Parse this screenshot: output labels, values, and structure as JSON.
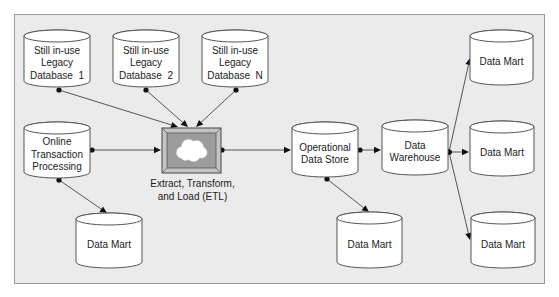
{
  "diagram": {
    "nodes": [
      {
        "id": "legacy1",
        "type": "database",
        "lines": [
          "Still in-use",
          "Legacy",
          "Database  1"
        ]
      },
      {
        "id": "legacy2",
        "type": "database",
        "lines": [
          "Still in-use",
          "Legacy",
          "Database  2"
        ]
      },
      {
        "id": "legacyN",
        "type": "database",
        "lines": [
          "Still in-use",
          "Legacy",
          "Database  N"
        ]
      },
      {
        "id": "oltp",
        "type": "database",
        "lines": [
          "Online",
          "Transaction",
          "Processing"
        ]
      },
      {
        "id": "etl",
        "type": "process",
        "icon": "cloud-icon",
        "lines": [
          "Extract, Transform,",
          "and Load (ETL)"
        ]
      },
      {
        "id": "ods",
        "type": "database",
        "lines": [
          "Operational",
          "Data Store"
        ]
      },
      {
        "id": "dw",
        "type": "database",
        "lines": [
          "Data",
          "Warehouse"
        ]
      },
      {
        "id": "mart_oltp",
        "type": "database",
        "lines": [
          "Data Mart"
        ]
      },
      {
        "id": "mart_ods",
        "type": "database",
        "lines": [
          "Data Mart"
        ]
      },
      {
        "id": "mart_dw1",
        "type": "database",
        "lines": [
          "Data Mart"
        ]
      },
      {
        "id": "mart_dw2",
        "type": "database",
        "lines": [
          "Data Mart"
        ]
      },
      {
        "id": "mart_dw3",
        "type": "database",
        "lines": [
          "Data Mart"
        ]
      }
    ],
    "edges": [
      {
        "from": "legacy1",
        "to": "etl"
      },
      {
        "from": "legacy2",
        "to": "etl"
      },
      {
        "from": "legacyN",
        "to": "etl"
      },
      {
        "from": "oltp",
        "to": "etl"
      },
      {
        "from": "oltp",
        "to": "mart_oltp"
      },
      {
        "from": "etl",
        "to": "ods"
      },
      {
        "from": "ods",
        "to": "dw"
      },
      {
        "from": "ods",
        "to": "mart_ods"
      },
      {
        "from": "dw",
        "to": "mart_dw1"
      },
      {
        "from": "dw",
        "to": "mart_dw2"
      },
      {
        "from": "dw",
        "to": "mart_dw3"
      }
    ]
  }
}
